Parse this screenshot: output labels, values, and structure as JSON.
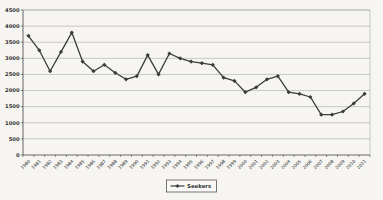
{
  "chart_data": {
    "type": "line",
    "title": "",
    "xlabel": "",
    "ylabel": "",
    "categories": [
      "1980",
      "1981",
      "1982",
      "1983",
      "1984",
      "1985",
      "1986",
      "1987",
      "1988",
      "1989",
      "1990",
      "1991",
      "1992",
      "1993",
      "1994",
      "1995",
      "1996",
      "1997",
      "1998",
      "1999",
      "2000",
      "2001",
      "2002",
      "2003",
      "2004",
      "2005",
      "2006",
      "2007",
      "2008",
      "2009",
      "2010",
      "2011"
    ],
    "series": [
      {
        "name": "Seekers",
        "marker": "diamond",
        "color": "#3c3c3c",
        "values": [
          3700,
          3250,
          2600,
          3200,
          3800,
          2900,
          2600,
          2800,
          2550,
          2350,
          2450,
          3100,
          2500,
          3150,
          3000,
          2900,
          2850,
          2800,
          2400,
          2300,
          1950,
          2100,
          2350,
          2450,
          1950,
          1900,
          1800,
          1250,
          1250,
          1350,
          1600,
          1900
        ]
      }
    ],
    "ylim": [
      0,
      4500
    ],
    "yticks": [
      0,
      500,
      1000,
      1500,
      2000,
      2500,
      3000,
      3500,
      4000,
      4500
    ],
    "grid": "horizontal",
    "legend_position": "bottom"
  },
  "legend": {
    "label": "Seekers"
  },
  "colors": {
    "background": "#f6f5f2",
    "plot_background": "#f6f5f2",
    "gridline": "#a8a8a8",
    "axis": "#5a5a5a",
    "series_line": "#3c3c3c",
    "text": "#2e2e2e",
    "legend_border": "#555555",
    "legend_background": "#faf9f7"
  }
}
